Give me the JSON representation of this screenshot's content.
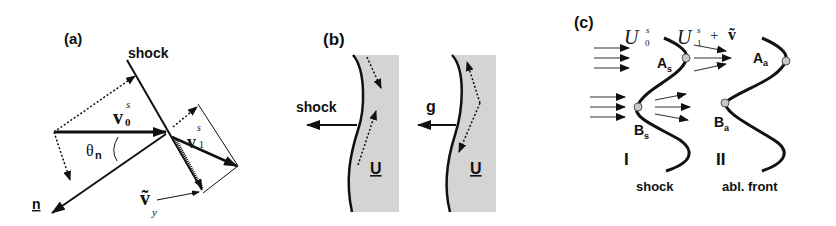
{
  "figure": {
    "panels": [
      {
        "id": "a",
        "label": "(a)",
        "shock_label": "shock",
        "vectors": {
          "v0": {
            "base": "v",
            "sup": "s",
            "sub": "0"
          },
          "v1": {
            "base": "v",
            "sup": "s",
            "sub": "1"
          },
          "vy": {
            "base": "ṽ",
            "sub": "y"
          },
          "n": "n"
        },
        "angle_label": "θ",
        "angle_sub": "n"
      },
      {
        "id": "b",
        "label": "(b)",
        "left": {
          "arrow_label": "shock",
          "velocity_label": "U"
        },
        "right": {
          "arrow_label": "g",
          "velocity_label": "U"
        },
        "fill_color": "#d4d4d4"
      },
      {
        "id": "c",
        "label": "(c)",
        "incoming_label": {
          "base": "U",
          "sup": "s",
          "sub": "0"
        },
        "outgoing_label": {
          "base": "U",
          "sup": "s",
          "sub": "1",
          "plus": "+",
          "extra": "ṽ"
        },
        "points": {
          "As": {
            "base": "A",
            "sub": "s"
          },
          "Bs": {
            "base": "B",
            "sub": "s"
          },
          "Aa": {
            "base": "A",
            "sub": "a"
          },
          "Ba": {
            "base": "B",
            "sub": "a"
          }
        },
        "region_I": "I",
        "region_II": "II",
        "front_labels": {
          "shock": "shock",
          "ablation": "abl. front"
        },
        "point_color": "#c8c8c8"
      }
    ]
  }
}
